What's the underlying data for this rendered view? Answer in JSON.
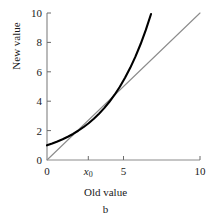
{
  "chart_data": {
    "type": "line",
    "title": "",
    "panel_label": "b",
    "xlabel": "Old value",
    "ylabel": "New value",
    "xlim": [
      0,
      10
    ],
    "ylim": [
      0,
      10
    ],
    "grid": false,
    "legend": "none",
    "x_ticks": [
      {
        "value": 0,
        "label": "0"
      },
      {
        "value": 2.7,
        "label": "x",
        "subscript": "0",
        "italic": true
      },
      {
        "value": 5,
        "label": "5"
      },
      {
        "value": 10,
        "label": "10"
      }
    ],
    "y_ticks": [
      {
        "value": 0,
        "label": "0"
      },
      {
        "value": 2,
        "label": "2"
      },
      {
        "value": 4,
        "label": "4"
      },
      {
        "value": 6,
        "label": "6"
      },
      {
        "value": 8,
        "label": "8"
      },
      {
        "value": 10,
        "label": "10"
      }
    ],
    "series": [
      {
        "name": "identity-line",
        "color": "#8c8c8c",
        "width": 1.1,
        "x": [
          0,
          10
        ],
        "values": [
          0,
          10
        ]
      },
      {
        "name": "transform-curve",
        "color": "#000000",
        "width": 2.1,
        "x": [
          0.0,
          0.34,
          0.68,
          1.02,
          1.36,
          1.7,
          2.04,
          2.38,
          2.72,
          3.06,
          3.4,
          3.74,
          4.08,
          4.42,
          4.76,
          5.1,
          5.44,
          5.78,
          6.12,
          6.46,
          6.8
        ],
        "values": [
          1.0,
          1.12,
          1.26,
          1.41,
          1.58,
          1.77,
          1.99,
          2.23,
          2.5,
          2.81,
          3.15,
          3.53,
          3.96,
          4.44,
          4.98,
          5.59,
          6.27,
          7.03,
          7.89,
          8.85,
          9.93
        ]
      }
    ],
    "intersections": [
      {
        "x": 2.72,
        "y": 2.72
      },
      {
        "x": 5.78,
        "y": 5.78
      }
    ]
  }
}
